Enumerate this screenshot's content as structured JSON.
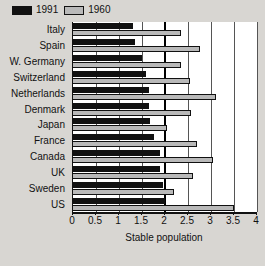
{
  "legend": {
    "position": "top-left",
    "entries": [
      {
        "label": "1991",
        "color": "#111111",
        "swatch": "legend-swatch-1991"
      },
      {
        "label": "1960",
        "color": "#b9b9b9",
        "swatch": "legend-swatch-1960"
      }
    ]
  },
  "chart_data": {
    "type": "bar",
    "orientation": "horizontal",
    "title": "",
    "subtitle": "",
    "xlabel": "Stable population",
    "ylabel": "",
    "xlim": [
      0,
      4
    ],
    "xticks": [
      0,
      0.5,
      1,
      1.5,
      2,
      2.5,
      3,
      3.5,
      4
    ],
    "xtick_labels": [
      "0",
      "0.5",
      "1",
      "1.5",
      "2",
      "2.5",
      "3",
      "3.5",
      "4"
    ],
    "grid": "vertical",
    "reference_line": 2,
    "legend_position": "top-left",
    "categories": [
      "Italy",
      "Spain",
      "W. Germany",
      "Switzerland",
      "Netherlands",
      "Denmark",
      "Japan",
      "France",
      "Canada",
      "UK",
      "Sweden",
      "US"
    ],
    "series": [
      {
        "name": "1991",
        "color": "#111111",
        "values": [
          1.3,
          1.35,
          1.5,
          1.58,
          1.65,
          1.65,
          1.68,
          1.75,
          1.9,
          1.9,
          1.95,
          2.0
        ]
      },
      {
        "name": "1960",
        "color": "#b9b9b9",
        "values": [
          2.35,
          2.75,
          2.35,
          2.55,
          3.1,
          2.57,
          2.05,
          2.7,
          3.05,
          2.6,
          2.2,
          3.5
        ]
      }
    ]
  }
}
